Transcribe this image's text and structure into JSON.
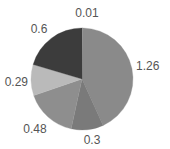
{
  "chart_data": {
    "type": "pie",
    "title": "",
    "categories": [
      "A",
      "B",
      "C",
      "D",
      "E",
      "F"
    ],
    "values": [
      0.01,
      1.26,
      0.3,
      0.48,
      0.29,
      0.6
    ],
    "labels": [
      "0.01",
      "1.26",
      "0.3",
      "0.48",
      "0.29",
      "0.6"
    ],
    "colors": [
      "#a8a8a8",
      "#8a8a8a",
      "#7a7a7a",
      "#8e8e8e",
      "#bababa",
      "#3c3c3c"
    ],
    "start_angle_deg": 0,
    "direction": "clockwise",
    "legend": "none"
  }
}
